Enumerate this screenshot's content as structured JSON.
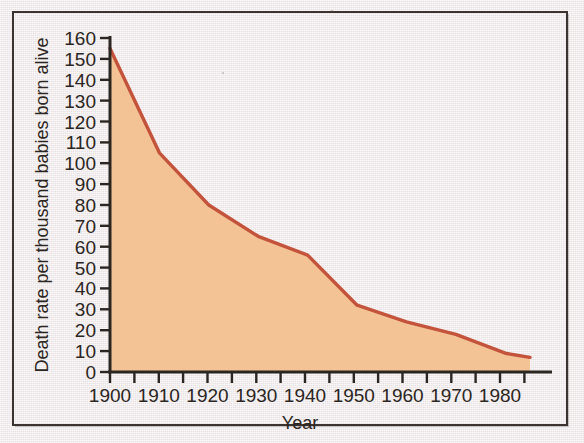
{
  "chart_data": {
    "type": "area",
    "title": "",
    "xlabel": "Year",
    "ylabel": "Death rate per thousand babies born alive",
    "x": [
      1900,
      1910,
      1920,
      1930,
      1940,
      1950,
      1960,
      1970,
      1980,
      1985
    ],
    "values": [
      155,
      105,
      80,
      65,
      56,
      32,
      24,
      18,
      9,
      7
    ],
    "xlim": [
      1900,
      1985
    ],
    "ylim": [
      0,
      160
    ],
    "xticks": [
      1900,
      1905,
      1910,
      1915,
      1920,
      1925,
      1930,
      1935,
      1940,
      1945,
      1950,
      1955,
      1960,
      1965,
      1970,
      1975,
      1980,
      1985
    ],
    "xticklabels": [
      "1900",
      "",
      "1910",
      "",
      "1920",
      "",
      "1930",
      "",
      "1940",
      "",
      "1950",
      "",
      "1960",
      "",
      "1970",
      "",
      "1980",
      ""
    ],
    "yticks": [
      0,
      10,
      20,
      30,
      40,
      50,
      60,
      70,
      80,
      90,
      100,
      110,
      120,
      130,
      140,
      150,
      160
    ],
    "yticklabels": [
      "0",
      "10",
      "20",
      "30",
      "40",
      "50",
      "60",
      "70",
      "80",
      "90",
      "100",
      "110",
      "120",
      "130",
      "140",
      "150",
      "160"
    ],
    "grid": false,
    "legend": null,
    "series": [
      {
        "name": "Infant death rate",
        "values": [
          155,
          105,
          80,
          65,
          56,
          32,
          24,
          18,
          9,
          7
        ]
      }
    ],
    "colors": {
      "line": "#c4533c",
      "fill": "#f3c396",
      "axis": "#2c2623",
      "background": "#efe8e9"
    }
  },
  "axes": {
    "x_title": "Year",
    "y_title": "Death rate per thousand babies born alive"
  }
}
